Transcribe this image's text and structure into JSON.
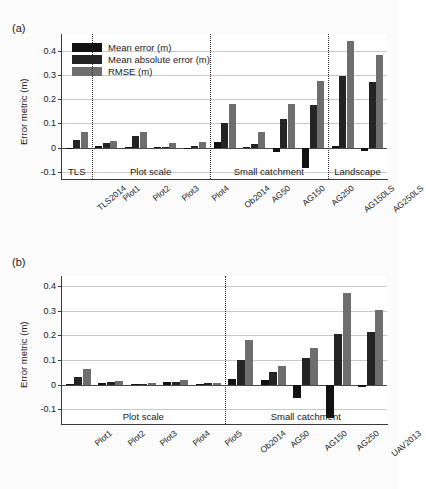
{
  "figure": {
    "panel_a_tag": "(a)",
    "panel_b_tag": "(b)"
  },
  "legend": {
    "items": [
      {
        "label": "Mean error (m)",
        "key": "me",
        "color": "#121212"
      },
      {
        "label": "Mean absolute error (m)",
        "key": "mae",
        "color": "#242424"
      },
      {
        "label": "RMSE (m)",
        "key": "rmse",
        "color": "#6e6e6e"
      }
    ]
  },
  "chart_data": [
    {
      "type": "bar",
      "panel": "(a)",
      "title": "",
      "xlabel": "",
      "ylabel": "Error metric (m)",
      "ylim": [
        -0.13,
        0.47
      ],
      "yticks": [
        -0.1,
        0,
        0.1,
        0.2,
        0.3,
        0.4
      ],
      "ytick_labels": [
        "-0.1",
        "0",
        "0.1",
        "0.2",
        "0.3",
        "0.4"
      ],
      "grid": true,
      "legend_position": "top-left",
      "categories": [
        "TLS2014",
        "Plot1",
        "Plot2",
        "Plot3",
        "Plot4",
        "Ob2014",
        "AG50",
        "AG150",
        "AG250",
        "AG150LS",
        "AG250LS"
      ],
      "groups": [
        {
          "name": "TLS",
          "members": [
            "TLS2014"
          ]
        },
        {
          "name": "Plot scale",
          "members": [
            "Plot1",
            "Plot2",
            "Plot3",
            "Plot4"
          ]
        },
        {
          "name": "Small catchment",
          "members": [
            "Ob2014",
            "AG50",
            "AG150",
            "AG250"
          ]
        },
        {
          "name": "Landscape",
          "members": [
            "AG150LS",
            "AG250LS"
          ]
        }
      ],
      "series": [
        {
          "name": "Mean error (m)",
          "key": "me",
          "values": [
            -0.004,
            0.006,
            0.001,
            0.002,
            -0.005,
            0.024,
            0.003,
            -0.019,
            -0.085,
            0.008,
            -0.013
          ]
        },
        {
          "name": "Mean absolute error (m)",
          "key": "mae",
          "values": [
            0.03,
            0.02,
            0.047,
            0.004,
            0.005,
            0.1,
            0.015,
            0.12,
            0.178,
            0.295,
            0.272
          ]
        },
        {
          "name": "RMSE (m)",
          "key": "rmse",
          "values": [
            0.063,
            0.027,
            0.065,
            0.017,
            0.025,
            0.181,
            0.064,
            0.18,
            0.277,
            0.44,
            0.385
          ]
        }
      ]
    },
    {
      "type": "bar",
      "panel": "(b)",
      "title": "",
      "xlabel": "",
      "ylabel": "Error metric (m)",
      "ylim": [
        -0.16,
        0.44
      ],
      "yticks": [
        -0.1,
        0,
        0.1,
        0.2,
        0.3,
        0.4
      ],
      "ytick_labels": [
        "-0.1",
        "0",
        "0.1",
        "0.2",
        "0.3",
        "0.4"
      ],
      "grid": true,
      "legend_position": "none",
      "categories": [
        "Plot1",
        "Plot2",
        "Plot3",
        "Plot4",
        "Plot5",
        "Ob2014",
        "AG50",
        "AG150",
        "AG250",
        "UAV2013"
      ],
      "groups": [
        {
          "name": "Plot scale",
          "members": [
            "Plot1",
            "Plot2",
            "Plot3",
            "Plot4",
            "Plot5"
          ]
        },
        {
          "name": "Small catchment",
          "members": [
            "Ob2014",
            "AG50",
            "AG150",
            "AG250",
            "UAV2013"
          ]
        }
      ],
      "series": [
        {
          "name": "Mean error (m)",
          "key": "me",
          "values": [
            0.004,
            0.008,
            0.002,
            0.011,
            0.003,
            0.022,
            0.02,
            -0.053,
            -0.137,
            -0.008
          ]
        },
        {
          "name": "Mean absolute error (m)",
          "key": "mae",
          "values": [
            0.03,
            0.009,
            0.004,
            0.012,
            0.005,
            0.098,
            0.052,
            0.106,
            0.205,
            0.214
          ]
        },
        {
          "name": "RMSE (m)",
          "key": "rmse",
          "values": [
            0.062,
            0.014,
            0.008,
            0.017,
            0.008,
            0.181,
            0.075,
            0.149,
            0.371,
            0.303
          ]
        }
      ]
    }
  ]
}
